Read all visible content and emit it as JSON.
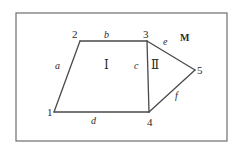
{
  "diagram": {
    "type": "planar-graph",
    "frame": {
      "x1": 16,
      "y1": 13,
      "x2": 227,
      "y2": 141,
      "stroke": "#6e6e6e"
    },
    "stroke_color": "#4a4a4a",
    "vertices": [
      {
        "id": "1",
        "label": "1",
        "x": 54,
        "y": 112,
        "lx": 47,
        "ly": 116
      },
      {
        "id": "2",
        "label": "2",
        "x": 80,
        "y": 41,
        "lx": 72,
        "ly": 38
      },
      {
        "id": "3",
        "label": "3",
        "x": 147,
        "y": 41,
        "lx": 143,
        "ly": 38
      },
      {
        "id": "4",
        "label": "4",
        "x": 149,
        "y": 112,
        "lx": 147,
        "ly": 126
      },
      {
        "id": "5",
        "label": "5",
        "x": 195,
        "y": 70,
        "lx": 197,
        "ly": 74
      }
    ],
    "edges": [
      {
        "id": "a",
        "label": "a",
        "from": "1",
        "to": "2",
        "lx": 55,
        "ly": 69
      },
      {
        "id": "b",
        "label": "b",
        "from": "2",
        "to": "3",
        "lx": 104,
        "ly": 38
      },
      {
        "id": "c",
        "label": "c",
        "from": "3",
        "to": "4",
        "lx": 134,
        "ly": 69
      },
      {
        "id": "d",
        "label": "d",
        "from": "1",
        "to": "4",
        "lx": 91,
        "ly": 124
      },
      {
        "id": "e",
        "label": "e",
        "from": "3",
        "to": "5",
        "lx": 163,
        "ly": 45
      },
      {
        "id": "f",
        "label": "f",
        "from": "4",
        "to": "5",
        "lx": 175,
        "ly": 99
      }
    ],
    "faces": [
      {
        "id": "I",
        "label": "Ⅰ",
        "lx": 104,
        "ly": 69
      },
      {
        "id": "II",
        "label": "Ⅱ",
        "lx": 151,
        "ly": 69
      }
    ],
    "outer_region": {
      "id": "M",
      "label": "M",
      "lx": 180,
      "ly": 41
    }
  }
}
